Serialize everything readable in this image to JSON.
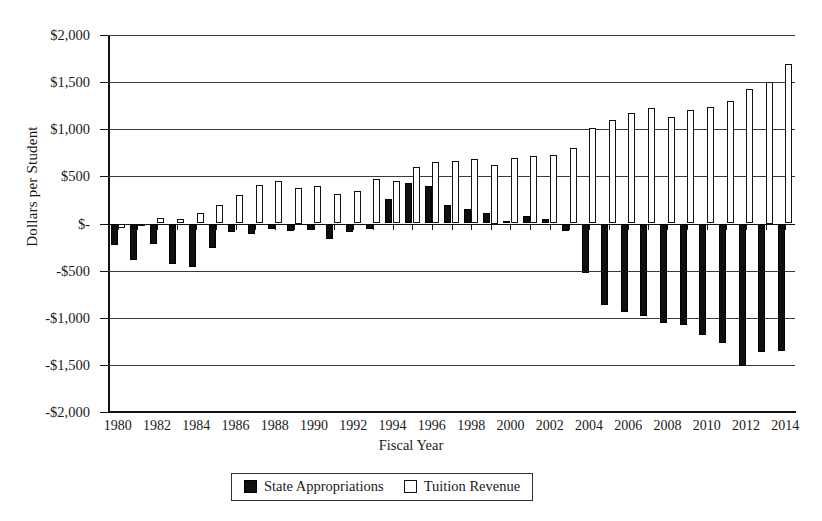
{
  "chart_data": {
    "type": "bar",
    "title": "",
    "xlabel": "Fiscal Year",
    "ylabel": "Dollars per Student",
    "ylim": [
      -2000,
      2000
    ],
    "grid": true,
    "legend_position": "bottom",
    "y_ticks": [
      {
        "value": 2000,
        "label": "$2,000"
      },
      {
        "value": 1500,
        "label": "$1,500"
      },
      {
        "value": 1000,
        "label": "$1,000"
      },
      {
        "value": 500,
        "label": "$500"
      },
      {
        "value": 0,
        "label": "$-"
      },
      {
        "value": -500,
        "label": "-$500"
      },
      {
        "value": -1000,
        "label": "-$1,000"
      },
      {
        "value": -1500,
        "label": "-$1,500"
      },
      {
        "value": -2000,
        "label": "-$2,000"
      }
    ],
    "categories": [
      "1980",
      "1981",
      "1982",
      "1983",
      "1984",
      "1985",
      "1986",
      "1987",
      "1988",
      "1989",
      "1990",
      "1991",
      "1992",
      "1993",
      "1994",
      "1995",
      "1996",
      "1997",
      "1998",
      "1999",
      "2000",
      "2001",
      "2002",
      "2003",
      "2004",
      "2005",
      "2006",
      "2007",
      "2008",
      "2009",
      "2010",
      "2011",
      "2012",
      "2013",
      "2014"
    ],
    "x_tick_labels": [
      "1980",
      "1982",
      "1984",
      "1986",
      "1988",
      "1990",
      "1992",
      "1994",
      "1996",
      "1998",
      "2000",
      "2002",
      "2004",
      "2006",
      "2008",
      "2010",
      "2012",
      "2014"
    ],
    "series": [
      {
        "name": "State Appropriations",
        "color": "#101010",
        "style": "filled",
        "values": [
          -230,
          -390,
          -220,
          -430,
          -460,
          -260,
          -90,
          -110,
          -60,
          -80,
          -70,
          -160,
          -90,
          -60,
          255,
          425,
          395,
          200,
          155,
          110,
          25,
          75,
          50,
          -75,
          -530,
          -870,
          -940,
          -980,
          -1060,
          -1080,
          -1180,
          -1265,
          -1510,
          -1360,
          -1355
        ]
      },
      {
        "name": "Tuition Revenue",
        "color": "#ffffff",
        "style": "outlined",
        "values": [
          -50,
          -25,
          55,
          50,
          110,
          195,
          305,
          405,
          450,
          375,
          400,
          315,
          345,
          470,
          450,
          600,
          650,
          660,
          680,
          625,
          700,
          715,
          730,
          800,
          1010,
          1095,
          1175,
          1230,
          1130,
          1205,
          1240,
          1305,
          1430,
          1500,
          1690
        ]
      }
    ]
  },
  "legend": {
    "entries": [
      {
        "label": "State Appropriations",
        "swatch": "filled-square"
      },
      {
        "label": "Tuition Revenue",
        "swatch": "outlined-square"
      }
    ]
  },
  "axes": {
    "y_title": "Dollars per Student",
    "x_title": "Fiscal Year"
  }
}
